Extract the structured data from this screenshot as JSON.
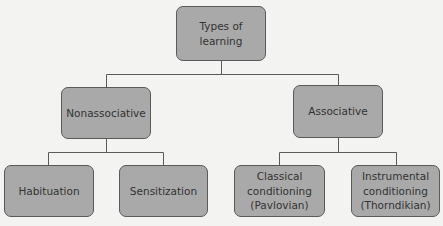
{
  "diagram": {
    "title": "Types of learning",
    "colors": {
      "background": "#f3f3f1",
      "node_fill": "#a9a9a9",
      "node_border": "#5a5a5a",
      "text": "#333333",
      "connector": "#5a5a5a"
    },
    "nodes": {
      "root": {
        "label": "Types of\nlearning"
      },
      "nonassociative": {
        "label": "Nonassociative"
      },
      "associative": {
        "label": "Associative"
      },
      "habituation": {
        "label": "Habituation"
      },
      "sensitization": {
        "label": "Sensitization"
      },
      "classical": {
        "label": "Classical\nconditioning\n(Pavlovian)"
      },
      "instrumental": {
        "label": "Instrumental\nconditioning\n(Thorndikian)"
      }
    },
    "edges": [
      {
        "from": "root",
        "to": "nonassociative"
      },
      {
        "from": "root",
        "to": "associative"
      },
      {
        "from": "nonassociative",
        "to": "habituation"
      },
      {
        "from": "nonassociative",
        "to": "sensitization"
      },
      {
        "from": "associative",
        "to": "classical"
      },
      {
        "from": "associative",
        "to": "instrumental"
      }
    ]
  }
}
